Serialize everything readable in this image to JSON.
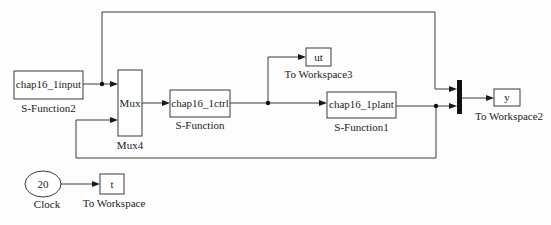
{
  "diagram": {
    "type": "simulink-block-diagram",
    "blocks": [
      {
        "id": "sfun2",
        "kind": "S-Function",
        "label": "chap16_1input",
        "caption": "S-Function2"
      },
      {
        "id": "mux4",
        "kind": "Mux",
        "label": "Mux",
        "caption": "Mux4"
      },
      {
        "id": "sfun",
        "kind": "S-Function",
        "label": "chap16_1ctrl",
        "caption": "S-Function"
      },
      {
        "id": "tows3",
        "kind": "To Workspace",
        "label": "ut",
        "caption": "To Workspace3"
      },
      {
        "id": "sfun1",
        "kind": "S-Function",
        "label": "chap16_1plant",
        "caption": "S-Function1"
      },
      {
        "id": "mux_bar",
        "kind": "Mux (bar)",
        "label": "",
        "caption": ""
      },
      {
        "id": "tows2",
        "kind": "To Workspace",
        "label": "y",
        "caption": "To Workspace2"
      },
      {
        "id": "clock",
        "kind": "Clock",
        "label": "20",
        "caption": "Clock"
      },
      {
        "id": "tows",
        "kind": "To Workspace",
        "label": "t",
        "caption": "To Workspace"
      }
    ],
    "connections": [
      {
        "from": "S-Function2",
        "to": "Mux4 (input 1)"
      },
      {
        "from": "S-Function2",
        "to": "Mux bar (input 1)",
        "via": "top branch"
      },
      {
        "from": "Mux4",
        "to": "S-Function"
      },
      {
        "from": "S-Function",
        "to": "To Workspace3"
      },
      {
        "from": "S-Function",
        "to": "S-Function1"
      },
      {
        "from": "S-Function1",
        "to": "Mux bar (input 2)"
      },
      {
        "from": "S-Function1",
        "to": "Mux4 (input 2)",
        "via": "feedback loop"
      },
      {
        "from": "Mux bar",
        "to": "To Workspace2"
      },
      {
        "from": "Clock",
        "to": "To Workspace"
      }
    ]
  }
}
